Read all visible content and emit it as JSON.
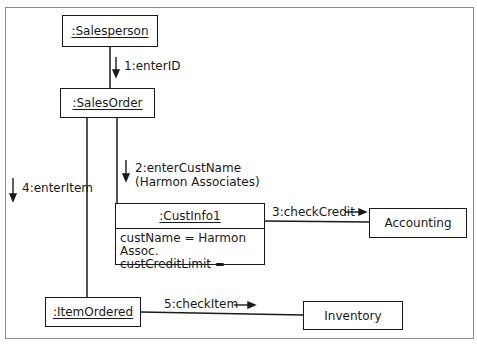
{
  "diagram": {
    "type": "UML collaboration diagram",
    "objects": {
      "salesperson": ":Salesperson",
      "salesorder": ":SalesOrder",
      "custinfo": {
        "name": ":CustInfo1",
        "attributes": [
          "custName = Harmon Assoc.",
          "custCreditLimit ="
        ]
      },
      "accounting": "Accounting",
      "itemordered": ":ItemOrdered",
      "inventory": "Inventory"
    },
    "messages": {
      "m1": "1:enterID",
      "m2_line1": "2:enterCustName",
      "m2_line2": "(Harmon Associates)",
      "m3": "3:checkCredit",
      "m4": "4:enterItem",
      "m5": "5:checkItem"
    },
    "links": [
      {
        "from": ":Salesperson",
        "to": ":SalesOrder"
      },
      {
        "from": ":SalesOrder",
        "to": ":CustInfo1"
      },
      {
        "from": ":SalesOrder",
        "to": ":ItemOrdered"
      },
      {
        "from": ":CustInfo1",
        "to": "Accounting"
      },
      {
        "from": ":ItemOrdered",
        "to": "Inventory"
      }
    ]
  }
}
